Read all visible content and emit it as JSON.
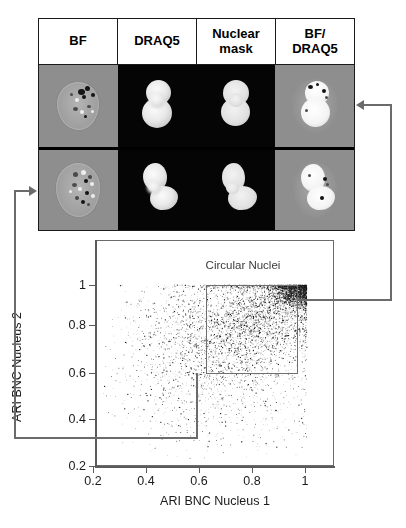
{
  "figure": {
    "panel_columns": [
      {
        "id": "bf",
        "label_lines": [
          "BF"
        ]
      },
      {
        "id": "draq5",
        "label_lines": [
          "DRAQ5"
        ]
      },
      {
        "id": "nuclear_mask",
        "label_lines": [
          "Nuclear",
          "mask"
        ]
      },
      {
        "id": "bf_draq5",
        "label_lines": [
          "BF/",
          "DRAQ5"
        ]
      }
    ],
    "panel_rows": [
      {
        "id": "row-circular-nuclei",
        "description": "Binucleated cell with two round circular nuclei",
        "cells": [
          {
            "column": "bf",
            "background": "#8e8e8e",
            "content": "brightfield-cell"
          },
          {
            "column": "draq5",
            "background": "#050505",
            "content": "two-round-nuclei"
          },
          {
            "column": "nuclear_mask",
            "background": "#050505",
            "content": "two-round-nuclei-mask"
          },
          {
            "column": "bf_draq5",
            "background": "#8e8e8e",
            "content": "overlay-two-round-nuclei"
          }
        ]
      },
      {
        "id": "row-noncircular-nuclei",
        "description": "Binucleated cell with two irregular lobed nuclei",
        "cells": [
          {
            "column": "bf",
            "background": "#8e8e8e",
            "content": "brightfield-cell"
          },
          {
            "column": "draq5",
            "background": "#050505",
            "content": "two-lobed-nuclei"
          },
          {
            "column": "nuclear_mask",
            "background": "#050505",
            "content": "two-lobed-nuclei-mask"
          },
          {
            "column": "bf_draq5",
            "background": "#8e8e8e",
            "content": "overlay-two-lobed-nuclei"
          }
        ]
      }
    ],
    "annotations": {
      "top_connector": {
        "label": "leader from Circular Nuclei gate to top-right BF/DRAQ5 panel",
        "arrow_direction": "left"
      },
      "bottom_connector": {
        "label": "leader from low-ARI region to bottom-left BF panel",
        "arrow_direction": "right"
      }
    }
  },
  "chart_data": {
    "type": "scatter",
    "title": "Circular Nuclei",
    "xlabel": "ARI BNC Nucleus 1",
    "ylabel": "ARI BNC Nucleus 2",
    "xlim": [
      0.13,
      1.09
    ],
    "ylim": [
      0.17,
      1.07
    ],
    "xticks": [
      0.2,
      0.4,
      0.6,
      0.8,
      1
    ],
    "xticklabels": [
      "0.2",
      "0.4",
      "0.6",
      "0.8",
      "1"
    ],
    "yticks": [
      0.4,
      0.6,
      0.8,
      1
    ],
    "yticklabels": [
      "0.4",
      "0.6",
      "0.8",
      "1"
    ],
    "extra_ytick": {
      "value": 0.2,
      "label": "0.2",
      "below_axis": true
    },
    "grid": false,
    "legend": null,
    "marker": {
      "color": "#1a1a1a",
      "size": 1.1,
      "shape": "dot"
    },
    "point_count": 6000,
    "gates": [
      {
        "name": "Circular Nuclei",
        "shape": "rect",
        "x_range": [
          0.645,
          1.015
        ],
        "y_range": [
          0.645,
          1.005
        ],
        "color": "#6f6f6f"
      }
    ],
    "density_note": "Points concentrate toward high ARI; densest cluster near (0.95, 0.98). Density falls off smoothly toward low x and low y; sparse tail below y=0.45.",
    "clusters": [
      {
        "cx": 0.96,
        "cy": 0.97,
        "sx": 0.045,
        "sy": 0.035,
        "weight": 0.3
      },
      {
        "cx": 0.86,
        "cy": 0.88,
        "sx": 0.105,
        "sy": 0.09,
        "weight": 0.24
      },
      {
        "cx": 0.72,
        "cy": 0.8,
        "sx": 0.15,
        "sy": 0.135,
        "weight": 0.22
      },
      {
        "cx": 0.62,
        "cy": 0.72,
        "sx": 0.175,
        "sy": 0.165,
        "weight": 0.14
      },
      {
        "cx": 0.66,
        "cy": 0.58,
        "sx": 0.19,
        "sy": 0.16,
        "weight": 0.07
      },
      {
        "cx": 0.7,
        "cy": 0.42,
        "sx": 0.195,
        "sy": 0.11,
        "weight": 0.03
      }
    ]
  }
}
